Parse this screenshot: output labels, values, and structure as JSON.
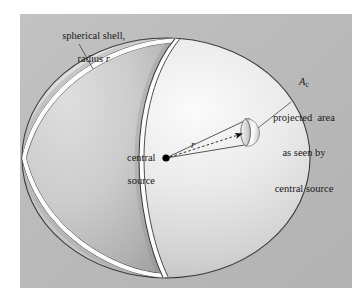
{
  "figure": {
    "panel": {
      "background_color": "#b9b9b9",
      "x": 20,
      "y": 14,
      "width": 332,
      "height": 274
    },
    "page_background_color": "#ffffff"
  },
  "labels": {
    "shell": {
      "line1": "spherical shell,",
      "line2_prefix": "radius ",
      "line2_symbol": "r",
      "full_text": "spherical shell, radius r"
    },
    "projected_area": {
      "symbol": "A",
      "subscript": "c",
      "line1": "projected  area",
      "line2": "as seen by",
      "line3": "central source",
      "full_text": "A_c projected area as seen by central source"
    },
    "central_source": {
      "line1": "central",
      "line2": "source",
      "full_text": "central source"
    },
    "radius_arrow": {
      "symbol": "r"
    }
  },
  "geometry": {
    "sphere": {
      "center_x": 166,
      "center_y": 158,
      "radius_x": 144,
      "radius_y": 120
    },
    "source_point": {
      "x": 166,
      "y": 158
    },
    "patch": {
      "x": 250,
      "y": 131,
      "rx": 7,
      "ry": 13
    },
    "terminator_note": "cut-away great circle separating near shaded half from far lit half"
  },
  "colors": {
    "panel": "#b9b9b9",
    "sphere_near_shade_light": "#d8d8d8",
    "sphere_near_shade_dark": "#a8a8a8",
    "sphere_far_light": "#f2f2f2",
    "sphere_far_mid": "#cfcfcf",
    "outline": "#3a3a3a",
    "shell_inner": "#ffffff",
    "text": "#1a1a1a",
    "source_dot": "#000000",
    "patch_highlight": "#fdfdfd",
    "patch_shadow": "#8c8c8c",
    "arrow_dark": "#111111"
  }
}
